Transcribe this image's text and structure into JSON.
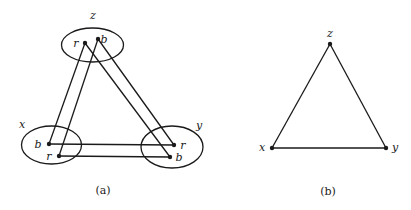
{
  "figure_a": {
    "caption": "(a)",
    "vertices": [
      {
        "id": "z",
        "label": "z",
        "ellipse": {
          "cx": 92.5,
          "cy": 45,
          "rx": 31,
          "ry": 17
        },
        "label_pos": [
          93,
          19
        ],
        "points": [
          {
            "label": "r",
            "x": 85,
            "y": 43,
            "label_pos": [
              76,
              47
            ]
          },
          {
            "label": "b",
            "x": 98,
            "y": 39,
            "label_pos": [
              103,
              43
            ]
          }
        ]
      },
      {
        "id": "x",
        "label": "x",
        "ellipse": {
          "cx": 51.5,
          "cy": 145,
          "rx": 30,
          "ry": 19
        },
        "label_pos": [
          22,
          128
        ],
        "points": [
          {
            "label": "b",
            "x": 49,
            "y": 144,
            "label_pos": [
              37,
              148
            ]
          },
          {
            "label": "r",
            "x": 59,
            "y": 156,
            "label_pos": [
              48,
              160
            ]
          }
        ]
      },
      {
        "id": "y",
        "label": "y",
        "ellipse": {
          "cx": 172,
          "cy": 147,
          "rx": 31,
          "ry": 21
        },
        "label_pos": [
          199,
          129
        ],
        "points": [
          {
            "label": "r",
            "x": 174,
            "y": 145,
            "label_pos": [
              182,
              149
            ]
          },
          {
            "label": "b",
            "x": 170,
            "y": 157,
            "label_pos": [
              177,
              161
            ]
          }
        ]
      }
    ],
    "edges": [
      {
        "from": "z.r",
        "to": "x.b"
      },
      {
        "from": "z.b",
        "to": "x.r"
      },
      {
        "from": "z.r",
        "to": "y.b"
      },
      {
        "from": "z.b",
        "to": "y.r"
      },
      {
        "from": "x.b",
        "to": "y.r"
      },
      {
        "from": "x.r",
        "to": "y.b"
      }
    ]
  },
  "figure_b": {
    "caption": "(b)",
    "vertices": [
      {
        "id": "z",
        "label": "z",
        "x": 330,
        "y": 44,
        "label_pos": [
          330,
          36
        ]
      },
      {
        "id": "x",
        "label": "x",
        "x": 272,
        "y": 148,
        "label_pos": [
          262,
          151
        ]
      },
      {
        "id": "y",
        "label": "y",
        "x": 386,
        "y": 148,
        "label_pos": [
          394,
          151
        ]
      }
    ],
    "edges": [
      {
        "from": "z",
        "to": "x"
      },
      {
        "from": "z",
        "to": "y"
      },
      {
        "from": "x",
        "to": "y"
      }
    ]
  }
}
